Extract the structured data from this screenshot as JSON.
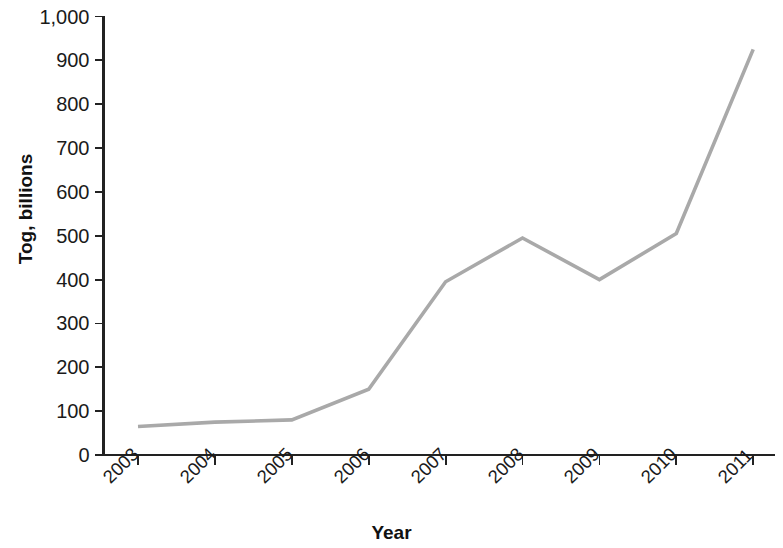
{
  "chart_data": {
    "type": "line",
    "title": "",
    "xlabel": "Year",
    "ylabel": "Tog, billions",
    "categories": [
      "2003",
      "2004",
      "2005",
      "2006",
      "2007",
      "2008",
      "2009",
      "2010",
      "2011"
    ],
    "values": [
      65,
      75,
      80,
      150,
      395,
      495,
      400,
      505,
      925
    ],
    "series": [
      {
        "name": "Tog, billions",
        "values": [
          65,
          75,
          80,
          150,
          395,
          495,
          400,
          505,
          925
        ]
      }
    ],
    "ylim": [
      0,
      1000
    ],
    "ytick_labels": [
      "0",
      "100",
      "200",
      "300",
      "400",
      "500",
      "600",
      "700",
      "800",
      "900",
      "1,000"
    ],
    "ytick_values": [
      0,
      100,
      200,
      300,
      400,
      500,
      600,
      700,
      800,
      900,
      1000
    ],
    "xtick_labels": [
      "2003",
      "2004",
      "2005",
      "2006",
      "2007",
      "2008",
      "2009",
      "2010",
      "2011"
    ],
    "xtick_rotation": -45,
    "grid": false,
    "legend": false,
    "legend_position": "none",
    "line_color": "#a9a9a9",
    "axis_color": "#222222",
    "background_color": "#ffffff",
    "annotations": []
  }
}
